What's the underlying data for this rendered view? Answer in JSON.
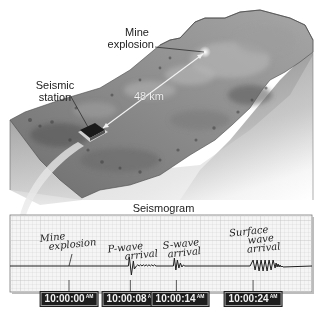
{
  "figure": {
    "terrain_labels": {
      "mine_explosion": [
        "Mine",
        "explosion"
      ],
      "seismic_station": [
        "Seismic",
        "station"
      ],
      "distance": "48 km"
    },
    "seismogram": {
      "title": "Seismogram",
      "events": [
        {
          "id": "mine-explosion",
          "label": [
            "Mine",
            "explosion"
          ],
          "time": "10:00:00",
          "ampm": "AM",
          "seconds": 0
        },
        {
          "id": "p-wave",
          "label": [
            "P-wave",
            "arrival"
          ],
          "time": "10:00:08",
          "ampm": "AM",
          "seconds": 8
        },
        {
          "id": "s-wave",
          "label": [
            "S-wave",
            "arrival"
          ],
          "time": "10:00:14",
          "ampm": "AM",
          "seconds": 14
        },
        {
          "id": "surface-wave",
          "label": [
            "Surface",
            "wave",
            "arrival"
          ],
          "time": "10:00:24",
          "ampm": "AM",
          "seconds": 24
        }
      ]
    },
    "colors": {
      "terrain_top": "#8a8a8a",
      "terrain_side": "#a9a9a9",
      "station": "#1a1a1a",
      "grid_line": "#c8c8c8",
      "trace": "#1e1e1e",
      "time_box": "#1d1d1d"
    }
  }
}
